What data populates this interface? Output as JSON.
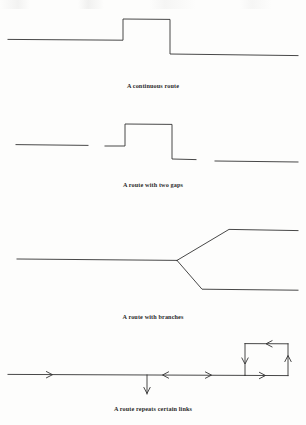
{
  "page": {
    "background_color": "#fdfdfc",
    "stroke_color": "#333333",
    "caption_color": "#2b2b2b"
  },
  "figures": [
    {
      "id": "figure-continuous-route",
      "caption": "A continuous route",
      "kind": "polyline-step",
      "description": "A single unbroken polyline: a low horizontal segment on the left, a raised plateau in the middle, and a lower horizontal segment on the right.",
      "segment_count": 1
    },
    {
      "id": "figure-route-two-gaps",
      "caption": "A route with two gaps",
      "kind": "polyline-step-broken",
      "description": "The same stepped route drawn as three disconnected pieces, leaving two gaps along the path.",
      "segment_count": 3,
      "gap_count": 2
    },
    {
      "id": "figure-route-branches",
      "caption": "A route with branches",
      "kind": "branching-tree",
      "description": "A horizontal trunk arriving from the left that forks at a junction into an upper branch and a lower branch, both running off to the right.",
      "branch_count": 2
    },
    {
      "id": "figure-route-repeats-links",
      "caption": "A route repeats certain links",
      "kind": "directed-graph-with-loop",
      "description": "A horizontal line carrying direction arrows, a short downward spur in the middle, and a rectangular counterclockwise loop at the right end showing links traversed more than once.",
      "arrow_count": 7,
      "loop_direction": "counterclockwise"
    }
  ]
}
